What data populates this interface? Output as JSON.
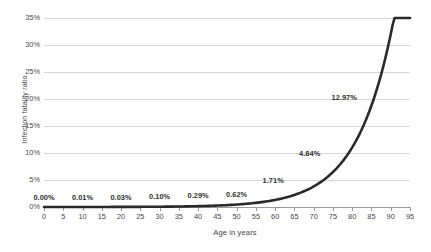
{
  "chart_data": {
    "type": "line",
    "title": "",
    "xlabel": "Age in years",
    "ylabel": "Infection fatality ratio",
    "xlim": [
      0,
      95
    ],
    "ylim": [
      0,
      35
    ],
    "grid": true,
    "legend": "none",
    "x_ticks": [
      "0",
      "5",
      "10",
      "15",
      "20",
      "25",
      "30",
      "35",
      "40",
      "45",
      "50",
      "55",
      "60",
      "65",
      "70",
      "75",
      "80",
      "85",
      "90",
      "95"
    ],
    "y_ticks": [
      "0%",
      "5%",
      "10%",
      "15%",
      "20%",
      "25%",
      "30%",
      "35%"
    ],
    "series": [
      {
        "name": "Infection fatality ratio",
        "color": "#2a2a2a",
        "x": [
          0,
          10,
          20,
          30,
          40,
          50,
          60,
          70,
          80,
          90
        ],
        "values": [
          0.0,
          0.01,
          0.03,
          0.1,
          0.29,
          0.62,
          1.71,
          4.84,
          12.97,
          30.4
        ],
        "point_labels": [
          "0.00%",
          "0.01%",
          "0.03%",
          "0.10%",
          "0.29%",
          "0.62%",
          "1.71%",
          "4.84%",
          "12.97%",
          "30.40%"
        ]
      }
    ]
  },
  "colors": {
    "curve": "#2a2a2a",
    "gridline": "#d6d6d6",
    "axis": "#9a9a9a",
    "text": "#46464a",
    "label_text": "#2e2e2e"
  }
}
